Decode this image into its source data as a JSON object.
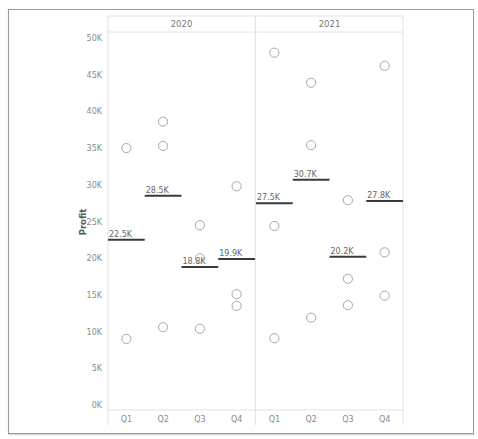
{
  "chart_data": {
    "type": "scatter",
    "title": "",
    "ylabel": "Profit",
    "xlabel": "",
    "ylim": [
      0,
      50000
    ],
    "y_ticks": [
      "0K",
      "5K",
      "10K",
      "15K",
      "20K",
      "25K",
      "30K",
      "35K",
      "40K",
      "45K",
      "50K"
    ],
    "y_tick_values": [
      0,
      5000,
      10000,
      15000,
      20000,
      25000,
      30000,
      35000,
      40000,
      45000,
      50000
    ],
    "panels": [
      "2020",
      "2021"
    ],
    "categories": [
      "Q1",
      "Q2",
      "Q3",
      "Q4"
    ],
    "grid": false,
    "legend": null,
    "series": [
      {
        "name": "2020",
        "points": [
          {
            "quarter": "Q1",
            "values": [
              35000,
              9000
            ]
          },
          {
            "quarter": "Q2",
            "values": [
              38600,
              35300,
              10600
            ]
          },
          {
            "quarter": "Q3",
            "values": [
              24500,
              20000,
              10400
            ]
          },
          {
            "quarter": "Q4",
            "values": [
              29800,
              15100,
              13500
            ]
          }
        ],
        "reference_lines": [
          {
            "quarter": "Q1",
            "value": 22500,
            "label": "22.5K"
          },
          {
            "quarter": "Q2",
            "value": 28500,
            "label": "28.5K"
          },
          {
            "quarter": "Q3",
            "value": 18800,
            "label": "18.8K"
          },
          {
            "quarter": "Q4",
            "value": 19900,
            "label": "19.9K"
          }
        ]
      },
      {
        "name": "2021",
        "points": [
          {
            "quarter": "Q1",
            "values": [
              48000,
              24400,
              9100
            ]
          },
          {
            "quarter": "Q2",
            "values": [
              43900,
              35400,
              11900
            ]
          },
          {
            "quarter": "Q3",
            "values": [
              27900,
              17200,
              13600
            ]
          },
          {
            "quarter": "Q4",
            "values": [
              46200,
              20800,
              14900
            ]
          }
        ],
        "reference_lines": [
          {
            "quarter": "Q1",
            "value": 27500,
            "label": "27.5K"
          },
          {
            "quarter": "Q2",
            "value": 30700,
            "label": "30.7K"
          },
          {
            "quarter": "Q3",
            "value": 20200,
            "label": "20.2K"
          },
          {
            "quarter": "Q4",
            "value": 27800,
            "label": "27.8K"
          }
        ]
      }
    ],
    "colors": {
      "marker_stroke": "#a8a8a8",
      "reference_line": "#3a3a3a",
      "label_text": "#666666",
      "axis_text": "#8a8a8a",
      "divider": "#e2e2e2"
    }
  }
}
